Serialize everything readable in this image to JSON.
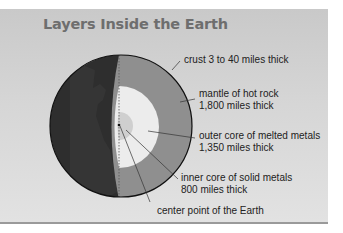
{
  "title": "Layers Inside the Earth",
  "labels": {
    "crust": "crust 3 to 40 miles thick",
    "mantle_line1": "mantle of hot rock",
    "mantle_line2": "1,800 miles thick",
    "outer_core_line1": "outer core of melted metals",
    "outer_core_line2": "1,350 miles thick",
    "inner_core_line1": "inner core of solid metals",
    "inner_core_line2": "800 miles thick",
    "center": "center point of the Earth"
  },
  "colors": {
    "background": "#d4d4d4",
    "surface": "#2e2e2e",
    "mantle": "#8f8f8f",
    "outer_core": "#ececec",
    "inner_core": "#cfcfcf",
    "title": "#6e6e6e"
  }
}
